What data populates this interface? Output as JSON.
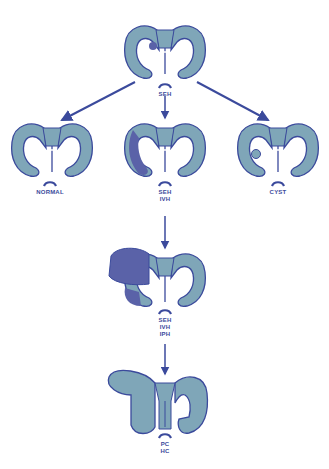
{
  "colors": {
    "ventricle_fill": "#7fa6b8",
    "outline": "#3b4a9c",
    "hemorrhage": "#5a62a8",
    "arrow": "#3b4a9c",
    "background": "#ffffff"
  },
  "nodes": [
    {
      "id": "top",
      "labels": [
        "SEH"
      ]
    },
    {
      "id": "normal",
      "labels": [
        "NORMAL"
      ]
    },
    {
      "id": "seh-ivh",
      "labels": [
        "SEH",
        "IVH"
      ]
    },
    {
      "id": "cyst",
      "labels": [
        "CYST"
      ]
    },
    {
      "id": "seh-ivh-iph",
      "labels": [
        "SEH",
        "IVH",
        "IPH"
      ]
    },
    {
      "id": "pc-hc",
      "labels": [
        "PC",
        "HC"
      ]
    }
  ],
  "edges": [
    {
      "from": "top",
      "to": "normal"
    },
    {
      "from": "top",
      "to": "seh-ivh"
    },
    {
      "from": "top",
      "to": "cyst"
    },
    {
      "from": "seh-ivh",
      "to": "seh-ivh-iph"
    },
    {
      "from": "seh-ivh-iph",
      "to": "pc-hc"
    }
  ]
}
